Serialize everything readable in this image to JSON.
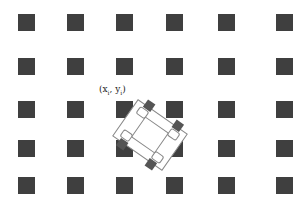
{
  "diagram": {
    "grid": {
      "columns_x": [
        18,
        67,
        116,
        166,
        218,
        276
      ],
      "rows_y": [
        14,
        58,
        101,
        140,
        177
      ],
      "square_color": "#3f3f3f"
    },
    "robot": {
      "center": [
        150,
        135
      ],
      "rotation_deg": 35,
      "label": "(x",
      "label_sub1": "i",
      "label_mid": ", y",
      "label_sub2": "i",
      "label_end": ")"
    }
  }
}
